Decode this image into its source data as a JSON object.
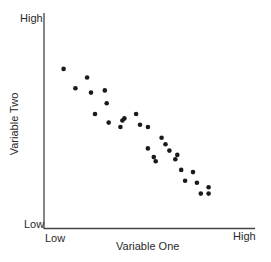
{
  "chart_data": {
    "type": "scatter",
    "title": "",
    "xlabel": "Variable One",
    "ylabel": "Variable Two",
    "x_ticks": [
      "Low",
      "High"
    ],
    "y_ticks": [
      "Low",
      "High"
    ],
    "xlim": [
      0,
      10
    ],
    "ylim": [
      0,
      10
    ],
    "grid": false,
    "legend": null,
    "point_color": "#1a1a1a",
    "points": [
      {
        "x": 1.0,
        "y": 7.4
      },
      {
        "x": 1.6,
        "y": 6.5
      },
      {
        "x": 2.2,
        "y": 7.0
      },
      {
        "x": 2.4,
        "y": 6.3
      },
      {
        "x": 2.6,
        "y": 5.3
      },
      {
        "x": 3.1,
        "y": 6.4
      },
      {
        "x": 3.2,
        "y": 5.8
      },
      {
        "x": 3.3,
        "y": 4.9
      },
      {
        "x": 4.0,
        "y": 5.0
      },
      {
        "x": 3.9,
        "y": 4.7
      },
      {
        "x": 4.1,
        "y": 5.1
      },
      {
        "x": 4.7,
        "y": 5.3
      },
      {
        "x": 4.9,
        "y": 4.8
      },
      {
        "x": 5.3,
        "y": 4.7
      },
      {
        "x": 5.3,
        "y": 3.7
      },
      {
        "x": 5.6,
        "y": 3.3
      },
      {
        "x": 6.0,
        "y": 4.2
      },
      {
        "x": 6.2,
        "y": 3.9
      },
      {
        "x": 6.4,
        "y": 3.6
      },
      {
        "x": 6.8,
        "y": 3.4
      },
      {
        "x": 6.7,
        "y": 3.2
      },
      {
        "x": 5.7,
        "y": 3.1
      },
      {
        "x": 7.0,
        "y": 2.7
      },
      {
        "x": 7.6,
        "y": 2.6
      },
      {
        "x": 7.2,
        "y": 2.2
      },
      {
        "x": 7.8,
        "y": 2.1
      },
      {
        "x": 8.4,
        "y": 1.9
      },
      {
        "x": 8.0,
        "y": 1.6
      },
      {
        "x": 8.4,
        "y": 1.6
      }
    ]
  },
  "labels": {
    "y_high": "High",
    "y_low": "Low",
    "x_low": "Low",
    "x_high": "High",
    "x_title": "Variable One",
    "y_title": "Variable Two"
  }
}
